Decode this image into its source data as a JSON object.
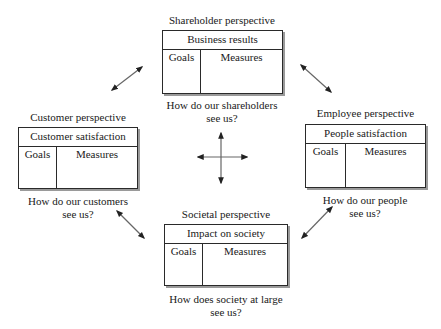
{
  "diagram": {
    "type": "balanced-scorecard-perspectives",
    "perspectives": [
      {
        "id": "shareholder",
        "label": "Shareholder perspective",
        "box_title": "Business results",
        "col_goals": "Goals",
        "col_measures": "Measures",
        "question_line1": "How do our shareholders",
        "question_line2": "see us?"
      },
      {
        "id": "customer",
        "label": "Customer perspective",
        "box_title": "Customer satisfaction",
        "col_goals": "Goals",
        "col_measures": "Measures",
        "question_line1": "How do our customers",
        "question_line2": "see us?"
      },
      {
        "id": "employee",
        "label": "Employee perspective",
        "box_title": "People satisfaction",
        "col_goals": "Goals",
        "col_measures": "Measures",
        "question_line1": "How do our people",
        "question_line2": "see us?"
      },
      {
        "id": "societal",
        "label": "Societal perspective",
        "box_title": "Impact on society",
        "col_goals": "Goals",
        "col_measures": "Measures",
        "question_line1": "How does society at large",
        "question_line2": "see us?"
      }
    ],
    "connectors": [
      {
        "from": "customer",
        "to": "shareholder",
        "style": "double-arrow"
      },
      {
        "from": "shareholder",
        "to": "employee",
        "style": "double-arrow"
      },
      {
        "from": "customer",
        "to": "societal",
        "style": "double-arrow"
      },
      {
        "from": "societal",
        "to": "employee",
        "style": "double-arrow"
      }
    ],
    "center_symbol": "four-way-arrow-cross",
    "colors": {
      "line": "#2a2a2a",
      "shadow": "#9a9a9a",
      "arrow": "#555555"
    }
  }
}
